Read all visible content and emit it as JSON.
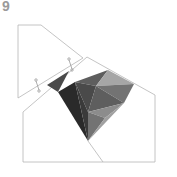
{
  "step": {
    "number": "9"
  },
  "diagram": {
    "colors": {
      "outline": "#b5b5b5",
      "paper": "#ffffff",
      "shade_darkest": "#2a2a2a",
      "shade_dark": "#4a4a4a",
      "shade_mid_dark": "#5e5e5e",
      "shade_mid": "#737373",
      "shade_mid_light": "#8c8c8c",
      "shade_light": "#a6a6a6",
      "shade_lightest": "#c2c2c2"
    }
  }
}
